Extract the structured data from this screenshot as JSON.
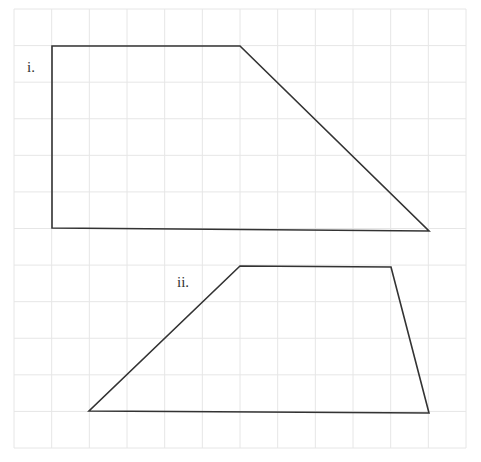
{
  "grid": {
    "left": 14,
    "top": 9,
    "right": 466,
    "bottom": 448,
    "columns": 12,
    "rows": 12,
    "line_color": "#e6e6e6"
  },
  "shape_color": "#333333",
  "shapes": [
    {
      "label": "i.",
      "label_pos": [
        27,
        75
      ],
      "points": [
        [
          52,
          46
        ],
        [
          240,
          46
        ],
        [
          429,
          231
        ],
        [
          52,
          228
        ]
      ]
    },
    {
      "label": "ii.",
      "label_pos": [
        177,
        290
      ],
      "points": [
        [
          240,
          266
        ],
        [
          391,
          267
        ],
        [
          429,
          413
        ],
        [
          89,
          411
        ]
      ]
    }
  ]
}
